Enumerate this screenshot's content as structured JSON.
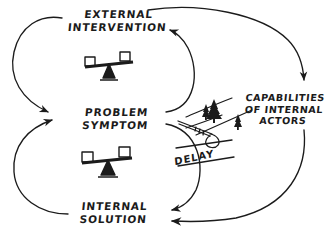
{
  "diagram": {
    "background_color": "#ffffff",
    "ink_color": "#1b1b1b",
    "nodes": [
      {
        "id": "external-intervention",
        "line1": "EXTERNAL",
        "line2": "INTERVENTION"
      },
      {
        "id": "problem-symptom",
        "line1": "PROBLEM",
        "line2": "SYMPTOM"
      },
      {
        "id": "internal-solution",
        "line1": "INTERNAL",
        "line2": "SOLUTION"
      },
      {
        "id": "capabilities-of-internal-actors",
        "line1": "CAPABILITIES",
        "line2": "OF INTERNAL",
        "line3": "ACTORS"
      }
    ],
    "delay_marker": {
      "label": "DELAY"
    },
    "icons": [
      {
        "id": "balance-scale-upper",
        "name": "balance-scale-icon"
      },
      {
        "id": "balance-scale-lower",
        "name": "balance-scale-icon"
      },
      {
        "id": "pine-trees-slope",
        "name": "pine-trees-icon"
      }
    ],
    "links": [
      {
        "from": "external-intervention",
        "to": "problem-symptom"
      },
      {
        "from": "problem-symptom",
        "to": "external-intervention"
      },
      {
        "from": "external-intervention",
        "to": "capabilities-of-internal-actors"
      },
      {
        "from": "problem-symptom",
        "to": "internal-solution"
      },
      {
        "from": "internal-solution",
        "to": "problem-symptom"
      },
      {
        "from": "capabilities-of-internal-actors",
        "to": "internal-solution"
      }
    ]
  }
}
